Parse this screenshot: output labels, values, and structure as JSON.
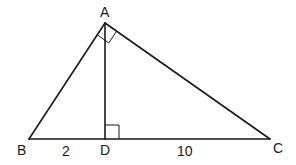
{
  "diagram": {
    "type": "geometry-right-triangle-with-altitude",
    "colors": {
      "stroke": "#1a1a1a",
      "background": "#ffffff"
    },
    "points": {
      "A": {
        "label": "A",
        "x": 105,
        "y": 23
      },
      "B": {
        "label": "B",
        "x": 29,
        "y": 139
      },
      "C": {
        "label": "C",
        "x": 270,
        "y": 139
      },
      "D": {
        "label": "D",
        "x": 105,
        "y": 139
      }
    },
    "segments": [
      {
        "from": "A",
        "to": "B"
      },
      {
        "from": "A",
        "to": "C"
      },
      {
        "from": "B",
        "to": "C"
      },
      {
        "from": "A",
        "to": "D"
      }
    ],
    "right_angles": [
      {
        "vertex": "A",
        "between": [
          "B",
          "C"
        ]
      },
      {
        "vertex": "D",
        "between": [
          "A",
          "C"
        ]
      }
    ],
    "lengths": {
      "BD": "2",
      "DC": "10"
    }
  }
}
